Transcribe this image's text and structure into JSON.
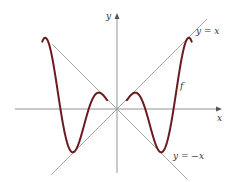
{
  "chart_data": {
    "type": "line",
    "title": "",
    "xlabel": "x",
    "ylabel": "y",
    "grid": false,
    "legend": "none",
    "xlim": [
      -10.5,
      11.5
    ],
    "ylim": [
      -7,
      10.5
    ],
    "series": [
      {
        "name": "y = x",
        "kind": "reference-line",
        "slope": 1,
        "color": "#9a9a9a",
        "label": "y = x"
      },
      {
        "name": "y = -x",
        "kind": "reference-line",
        "slope": -1,
        "color": "#9a9a9a",
        "label": "y = −x"
      },
      {
        "name": "f",
        "kind": "function",
        "expression": "x*sin(x)",
        "domain": [
          [
            -8.3,
            -1.1
          ],
          [
            1.1,
            8.3
          ]
        ],
        "color": "#6b1a1f",
        "label": "f"
      }
    ],
    "annotations": [
      {
        "text": "y = x",
        "near": "top-right"
      },
      {
        "text": "y = −x",
        "near": "bottom-right"
      },
      {
        "text": "f",
        "near": "right-middle"
      },
      {
        "text": "x",
        "near": "x-axis-end"
      },
      {
        "text": "y",
        "near": "y-axis-top"
      }
    ]
  }
}
